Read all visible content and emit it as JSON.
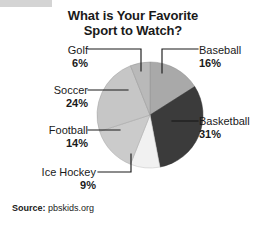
{
  "chart_data": {
    "type": "pie",
    "title": "What is Your Favorite Sport to Watch?",
    "title_lines": [
      "What is Your Favorite",
      "Sport to Watch?"
    ],
    "categories": [
      "Baseball",
      "Basketball",
      "Ice Hockey",
      "Football",
      "Soccer",
      "Golf"
    ],
    "values": [
      16,
      31,
      9,
      14,
      24,
      6
    ],
    "value_suffix": "%",
    "slice_colors": [
      "#a9a9a9",
      "#3b3b3b",
      "#f1f1f1",
      "#cbcbcb",
      "#c6c6c6",
      "#b9b9b9"
    ],
    "legend": "none",
    "grid": false,
    "start_angle_deg": 0,
    "direction": "clockwise",
    "source_label": "Source:",
    "source_value": "pbskids.org",
    "slices": [
      {
        "name": "Baseball",
        "value": 16,
        "pct_text": "16%",
        "color": "#a9a9a9"
      },
      {
        "name": "Basketball",
        "value": 31,
        "pct_text": "31%",
        "color": "#3b3b3b"
      },
      {
        "name": "Ice Hockey",
        "value": 9,
        "pct_text": "9%",
        "color": "#f1f1f1"
      },
      {
        "name": "Football",
        "value": 14,
        "pct_text": "14%",
        "color": "#cbcbcb"
      },
      {
        "name": "Soccer",
        "value": 24,
        "pct_text": "24%",
        "color": "#c6c6c6"
      },
      {
        "name": "Golf",
        "value": 6,
        "pct_text": "6%",
        "color": "#b9b9b9"
      }
    ]
  },
  "labels": {
    "golf": {
      "name": "Golf",
      "pct": "6%"
    },
    "soccer": {
      "name": "Soccer",
      "pct": "24%"
    },
    "football": {
      "name": "Football",
      "pct": "14%"
    },
    "ice_hockey": {
      "name": "Ice Hockey",
      "pct": "9%"
    },
    "baseball": {
      "name": "Baseball",
      "pct": "16%"
    },
    "basketball": {
      "name": "Basketball",
      "pct": "31%"
    }
  },
  "title": {
    "line1": "What is Your Favorite",
    "line2": "Sport to Watch?"
  },
  "source": {
    "label": "Source:",
    "value": "pbskids.org"
  }
}
